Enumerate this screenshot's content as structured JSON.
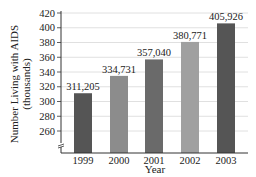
{
  "chart_data": {
    "type": "bar",
    "title": "",
    "xlabel": "Year",
    "ylabel": "Number Living with AIDS",
    "ylabel_units": "(thousands)",
    "categories": [
      "1999",
      "2000",
      "2001",
      "2002",
      "2003"
    ],
    "values": [
      311205,
      334731,
      357040,
      380771,
      405926
    ],
    "value_labels": [
      "311,205",
      "334,731",
      "357,040",
      "380,771",
      "405,926"
    ],
    "ylim": [
      240,
      420
    ],
    "yticks": [
      260,
      280,
      300,
      320,
      340,
      360,
      380,
      400,
      420
    ],
    "y_axis_break": true,
    "grid": true,
    "legend": null,
    "bar_colors": [
      "#555555",
      "#8c8c8c",
      "#6a6a6a",
      "#a0a0a0",
      "#555555"
    ]
  }
}
